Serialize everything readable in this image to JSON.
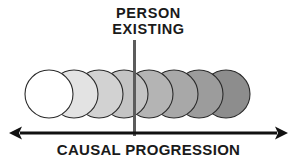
{
  "figure": {
    "background_color": "#ffffff",
    "width": 297,
    "height": 166
  },
  "marker": {
    "label_line_1": "PERSON",
    "label_line_2": "EXISTING",
    "line_color": "#5c5c5c",
    "line_x": 134,
    "line_top": 40,
    "line_bottom": 136
  },
  "axis": {
    "caption": "CAUSAL PROGRESSION",
    "color": "#111111",
    "y": 133,
    "x_start": 9,
    "x_end": 288,
    "double_headed": true
  },
  "chart_data": {
    "type": "diagram",
    "xlabel": "CAUSAL PROGRESSION",
    "annotations": [
      "PERSON",
      "EXISTING"
    ],
    "circle_count": 8,
    "circle_radius": 24,
    "circle_center_y": 94,
    "circles": [
      {
        "index": 1,
        "cx": 49,
        "fill": "#ffffff",
        "stroke": "#2b2b2b"
      },
      {
        "index": 2,
        "cx": 74,
        "fill": "#e3e3e3",
        "stroke": "#2b2b2b"
      },
      {
        "index": 3,
        "cx": 99,
        "fill": "#d2d2d2",
        "stroke": "#2b2b2b"
      },
      {
        "index": 4,
        "cx": 124,
        "fill": "#c4c4c4",
        "stroke": "#2b2b2b"
      },
      {
        "index": 5,
        "cx": 149,
        "fill": "#b4b4b4",
        "stroke": "#2b2b2b"
      },
      {
        "index": 6,
        "cx": 174,
        "fill": "#a8a8a8",
        "stroke": "#2b2b2b"
      },
      {
        "index": 7,
        "cx": 199,
        "fill": "#9c9c9c",
        "stroke": "#2b2b2b"
      },
      {
        "index": 8,
        "cx": 226,
        "fill": "#8d8d8d",
        "stroke": "#2b2b2b"
      }
    ]
  }
}
